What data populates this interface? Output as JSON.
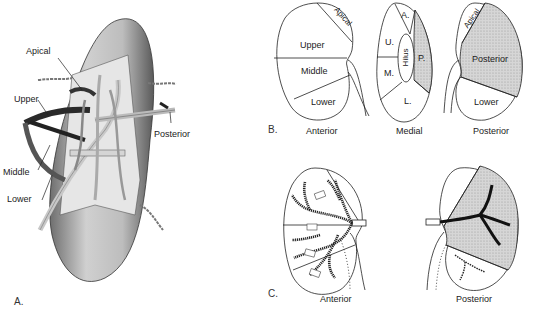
{
  "figure": {
    "panels": [
      {
        "id": "A",
        "letter": "A.",
        "description": "Illustration of kidney with exposed segmental arteries",
        "labels": {
          "apical": "Apical",
          "upper": "Upper",
          "middle": "Middle",
          "lower": "Lower",
          "posterior": "Posterior"
        }
      },
      {
        "id": "B",
        "letter": "B.",
        "views": [
          {
            "name": "Anterior",
            "segments": [
              "Apical",
              "Upper",
              "Middle",
              "Lower"
            ]
          },
          {
            "name": "Medial",
            "segments": [
              "A.",
              "U.",
              "M.",
              "L.",
              "P."
            ],
            "center": "Hilus"
          },
          {
            "name": "Posterior",
            "segments": [
              "Apical",
              "Posterior",
              "Lower"
            ]
          }
        ]
      },
      {
        "id": "C",
        "letter": "C.",
        "views": [
          {
            "name": "Anterior"
          },
          {
            "name": "Posterior"
          }
        ]
      }
    ],
    "colors": {
      "line": "#222222",
      "shade": "#cfcfcf",
      "kidney_tone": "#bdbdbd"
    }
  }
}
